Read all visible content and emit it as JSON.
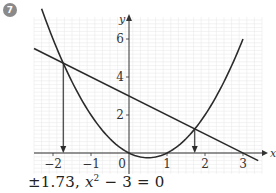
{
  "question_number": "7",
  "answer": {
    "prefix": "±1.73, ",
    "equation_var": "x",
    "equation_exp": "2",
    "equation_rest": " − 3 = 0"
  },
  "axes": {
    "x_label": "x",
    "y_label": "y"
  },
  "colors": {
    "grid_minor": "#e6e6e6",
    "grid_major": "#cfcfcf",
    "curve": "#2b2b2b",
    "axis": "#333333",
    "badge": "#8a8a8a"
  },
  "chart_data": {
    "type": "line",
    "title": "",
    "xlabel": "x",
    "ylabel": "y",
    "xlim": [
      -2.5,
      3.5
    ],
    "ylim": [
      -0.5,
      7.0
    ],
    "x_ticks": [
      -2,
      -1,
      0,
      1,
      2,
      3
    ],
    "y_ticks": [
      2,
      4,
      6
    ],
    "grid": true,
    "series": [
      {
        "name": "y = x^2 - x",
        "kind": "curve",
        "x": [
          -2.3,
          -2,
          -1.73,
          -1,
          0,
          0.5,
          1,
          1.73,
          2,
          2.5,
          3
        ],
        "y": [
          7.59,
          6,
          4.73,
          2,
          0,
          -0.25,
          0,
          1.27,
          2,
          3.75,
          6
        ]
      },
      {
        "name": "y = 3 - x",
        "kind": "line",
        "x": [
          -2.5,
          3.4
        ],
        "y": [
          5.5,
          -0.4
        ]
      }
    ],
    "annotations": [
      {
        "type": "arrow",
        "from": [
          -1.73,
          4.73
        ],
        "to": [
          -1.73,
          0
        ],
        "label": "x = -1.73"
      },
      {
        "type": "arrow",
        "from": [
          1.73,
          1.27
        ],
        "to": [
          1.73,
          0
        ],
        "label": "x = 1.73"
      }
    ],
    "intersections": [
      [
        -1.73,
        4.73
      ],
      [
        1.73,
        1.27
      ]
    ]
  }
}
